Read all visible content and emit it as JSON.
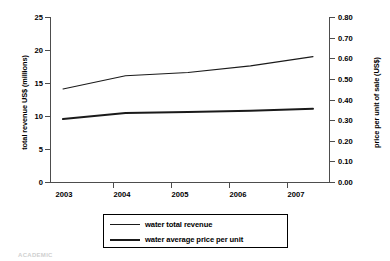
{
  "chart_data": {
    "type": "line",
    "title": "",
    "xlabel": "",
    "categories": [
      "2003",
      "2004",
      "2005",
      "2006",
      "2007"
    ],
    "x": [
      2003,
      2004,
      2005,
      2006,
      2007
    ],
    "grid": false,
    "legend_position": "bottom",
    "axes": {
      "left": {
        "label": "total revenue US$ (millions)",
        "ticks": [
          "0",
          "5",
          "10",
          "15",
          "20",
          "25"
        ],
        "tick_values": [
          0,
          5,
          10,
          15,
          20,
          25
        ],
        "ylim": [
          0,
          25
        ]
      },
      "right": {
        "label": "price per unit of sale (US$)",
        "ticks": [
          "0.00",
          "0.10",
          "0.20",
          "0.30",
          "0.40",
          "0.50",
          "0.60",
          "0.70",
          "0.80"
        ],
        "tick_values": [
          0.0,
          0.1,
          0.2,
          0.3,
          0.4,
          0.5,
          0.6,
          0.7,
          0.8
        ],
        "ylim": [
          0,
          0.8
        ]
      }
    },
    "series": [
      {
        "name": "water total revenue",
        "axis": "left",
        "style": "thin",
        "color": "#1a1a1a",
        "values": [
          14.1,
          16.1,
          16.6,
          17.6,
          19.0
        ]
      },
      {
        "name": "water average price per unit",
        "axis": "right",
        "style": "thick",
        "color": "#1a1a1a",
        "values": [
          0.305,
          0.335,
          0.34,
          0.345,
          0.355
        ]
      }
    ]
  },
  "legend": {
    "items": [
      {
        "label": "water total revenue",
        "style": "thin"
      },
      {
        "label": "water average price per unit",
        "style": "thick"
      }
    ]
  },
  "footer": {
    "artifact_text": "ACADEMIC"
  }
}
